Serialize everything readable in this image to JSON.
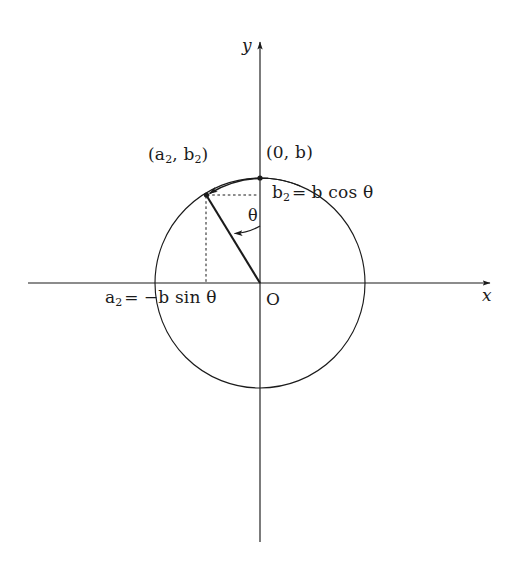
{
  "figure": {
    "background_color": "#ffffff",
    "ink_color": "#1b1b1b",
    "axes": {
      "x_label": "x",
      "y_label": "y",
      "origin_label": "O"
    },
    "angle": {
      "symbol": "θ"
    },
    "labels": {
      "point_on_circle": {
        "open": "(",
        "a": "a",
        "a_sub": "2",
        "comma": ", ",
        "b": "b",
        "b_sub": "2",
        "close": ")",
        "full": "(a2, b2)"
      },
      "top_point": {
        "full": "(0, b)"
      },
      "cos_relation": {
        "lhs": "b",
        "lhs_sub": "2",
        "equals": "=",
        "rhs": "b cos θ",
        "full": "b2 = b cos θ"
      },
      "sin_relation": {
        "lhs": "a",
        "lhs_sub": "2",
        "equals": "=",
        "rhs": "−b sin θ",
        "full": "a2 = −b sin θ"
      }
    },
    "geometry": {
      "center_x": 260,
      "center_y": 283,
      "radius": 105,
      "point_x": 206,
      "point_y": 195,
      "top_point_x": 260,
      "top_point_y": 178,
      "x_axis_start": 28,
      "x_axis_end": 492,
      "y_axis_top": 40,
      "y_axis_bottom": 542
    }
  }
}
